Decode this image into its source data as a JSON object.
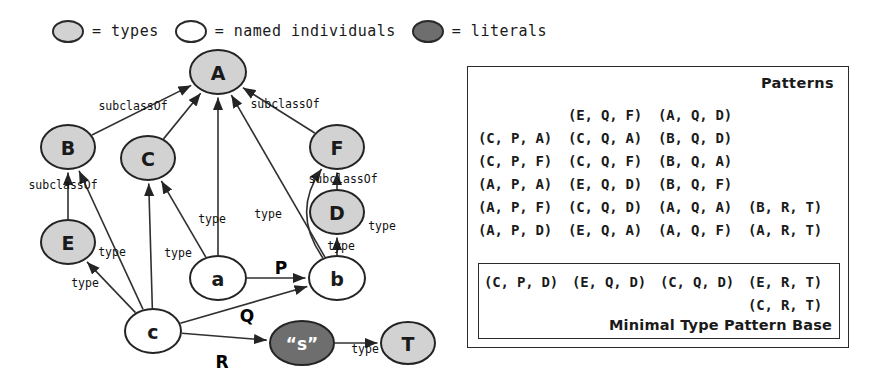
{
  "legend": {
    "items": [
      {
        "swatch": "types-swatch",
        "text": "= types"
      },
      {
        "swatch": "named-individuals-swatch",
        "text": "= named individuals"
      },
      {
        "swatch": "literals-swatch",
        "text": "= literals"
      }
    ]
  },
  "graph": {
    "nodes": [
      {
        "id": "A",
        "label": "A",
        "kind": "type",
        "cx": 218,
        "cy": 26,
        "rx": 28,
        "ry": 22
      },
      {
        "id": "B",
        "label": "B",
        "kind": "type",
        "cx": 68,
        "cy": 101,
        "rx": 27,
        "ry": 22
      },
      {
        "id": "C",
        "label": "C",
        "kind": "type",
        "cx": 148,
        "cy": 112,
        "rx": 27,
        "ry": 22
      },
      {
        "id": "F",
        "label": "F",
        "kind": "type",
        "cx": 337,
        "cy": 101,
        "rx": 27,
        "ry": 22
      },
      {
        "id": "D",
        "label": "D",
        "kind": "type",
        "cx": 337,
        "cy": 166,
        "rx": 27,
        "ry": 22
      },
      {
        "id": "E",
        "label": "E",
        "kind": "type",
        "cx": 68,
        "cy": 196,
        "rx": 27,
        "ry": 22
      },
      {
        "id": "T",
        "label": "T",
        "kind": "type",
        "cx": 408,
        "cy": 297,
        "rx": 27,
        "ry": 21
      },
      {
        "id": "a",
        "label": "a",
        "kind": "named",
        "cx": 218,
        "cy": 232,
        "rx": 28,
        "ry": 22
      },
      {
        "id": "b",
        "label": "b",
        "kind": "named",
        "cx": 337,
        "cy": 232,
        "rx": 28,
        "ry": 22
      },
      {
        "id": "c",
        "label": "c",
        "kind": "named",
        "cx": 153,
        "cy": 285,
        "rx": 28,
        "ry": 22
      },
      {
        "id": "s",
        "label": "“s”",
        "kind": "literal",
        "cx": 302,
        "cy": 297,
        "rx": 32,
        "ry": 22
      }
    ],
    "edges": [
      {
        "from": "B",
        "to": "A",
        "label": "subclassOf",
        "lx": 133,
        "ly": 60
      },
      {
        "from": "C",
        "to": "A",
        "label": "",
        "lx": 0,
        "ly": 0
      },
      {
        "from": "F",
        "to": "A",
        "label": "subclassOf",
        "lx": 285,
        "ly": 58
      },
      {
        "from": "E",
        "to": "B",
        "label": "subclassOf",
        "lx": 63,
        "ly": 139
      },
      {
        "from": "D",
        "to": "F",
        "label": "subclassOf",
        "lx": 343,
        "ly": 133
      },
      {
        "from": "a",
        "to": "A",
        "label": "type",
        "lx": 212,
        "ly": 173
      },
      {
        "from": "a",
        "to": "C",
        "label": "type",
        "lx": 178,
        "ly": 207
      },
      {
        "from": "a",
        "to": "b",
        "label": "P",
        "lx": 281,
        "ly": 222
      },
      {
        "from": "b",
        "to": "A",
        "label": "type",
        "lx": 268,
        "ly": 168
      },
      {
        "from": "b",
        "to": "D",
        "label": "type",
        "lx": 341,
        "ly": 200
      },
      {
        "from": "b",
        "to": "F",
        "label": "type",
        "lx": 382,
        "ly": 180
      },
      {
        "from": "c",
        "to": "B",
        "label": "type",
        "lx": 112,
        "ly": 206
      },
      {
        "from": "c",
        "to": "C",
        "label": "",
        "lx": 0,
        "ly": 0
      },
      {
        "from": "c",
        "to": "E",
        "label": "type",
        "lx": 85,
        "ly": 237
      },
      {
        "from": "c",
        "to": "b",
        "label": "Q",
        "lx": 247,
        "ly": 270
      },
      {
        "from": "c",
        "to": "s",
        "label": "R",
        "lx": 222,
        "ly": 316
      },
      {
        "from": "s",
        "to": "T",
        "label": "type",
        "lx": 365,
        "ly": 303
      }
    ]
  },
  "patterns": {
    "title": "Patterns",
    "rows": [
      [
        "",
        "(E, Q, F)",
        "(A, Q, D)",
        ""
      ],
      [
        "(C, P, A)",
        "(C, Q, A)",
        "(B, Q, D)",
        ""
      ],
      [
        "(C, P, F)",
        "(C, Q, F)",
        "(B, Q, A)",
        ""
      ],
      [
        "(A, P, A)",
        "(E, Q, D)",
        "(B, Q, F)",
        ""
      ],
      [
        "(A, P, F)",
        "(C, Q, D)",
        "(A, Q, A)",
        "(B, R, T)"
      ],
      [
        "(A, P, D)",
        "(E, Q, A)",
        "(A, Q, F)",
        "(A, R, T)"
      ]
    ],
    "minimal_base": {
      "rows": [
        [
          "(C, P, D)",
          "(E, Q, D)",
          "(C, Q, D)",
          "(E, R, T)"
        ],
        [
          "",
          "",
          "",
          "(C, R, T)"
        ]
      ],
      "caption": "Minimal Type Pattern Base"
    }
  }
}
